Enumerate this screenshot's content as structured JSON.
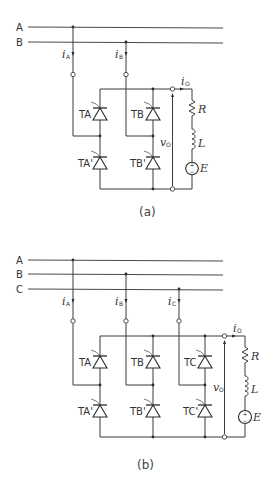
{
  "figure_a": {
    "caption": "(a)",
    "lines": [
      "A",
      "B"
    ],
    "currents": {
      "iA": "i",
      "iA_sub": "A",
      "iB": "i",
      "iB_sub": "B",
      "io": "i",
      "io_sub": "O"
    },
    "thyristors": {
      "TA": "TA",
      "TA_prime": "TA'",
      "TB": "TB",
      "TB_prime": "TB'"
    },
    "output_voltage": {
      "sym": "v",
      "sub": "O"
    },
    "load": {
      "R": "R",
      "L": "L",
      "E": "E",
      "plus": "+",
      "minus": "−"
    }
  },
  "figure_b": {
    "caption": "(b)",
    "lines": [
      "A",
      "B",
      "C"
    ],
    "currents": {
      "iA": "i",
      "iA_sub": "A",
      "iB": "i",
      "iB_sub": "B",
      "iC": "i",
      "iC_sub": "C",
      "io": "i",
      "io_sub": "O"
    },
    "thyristors": {
      "TA": "TA",
      "TA_prime": "TA'",
      "TB": "TB",
      "TB_prime": "TB'",
      "TC": "TC",
      "TC_prime": "TC'"
    },
    "output_voltage": {
      "sym": "v",
      "sub": "O"
    },
    "load": {
      "R": "R",
      "L": "L",
      "E": "E",
      "plus": "+",
      "minus": "−"
    }
  }
}
